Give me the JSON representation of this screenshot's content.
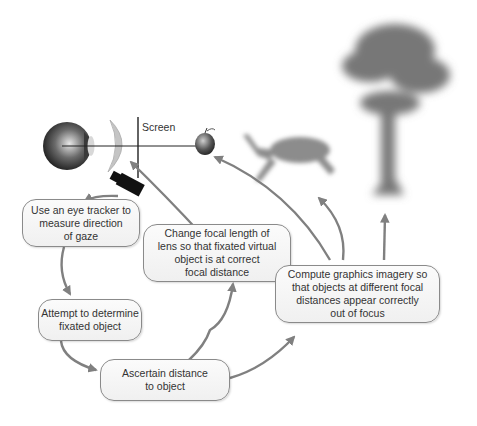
{
  "diagram": {
    "type": "flow",
    "screen_label": "Screen",
    "boxes": [
      {
        "id": "eye-tracker",
        "text": "Use an eye tracker to\nmeasure direction\nof gaze"
      },
      {
        "id": "fixated-object",
        "text": "Attempt to determine\nfixated object"
      },
      {
        "id": "ascertain-distance",
        "text": "Ascertain distance\nto object"
      },
      {
        "id": "change-focal",
        "text": "Change focal length of\nlens so that fixated virtual\nobject is at correct\nfocal distance"
      },
      {
        "id": "compute-graphics",
        "text": "Compute graphics imagery so\nthat objects at different focal\ndistances appear correctly\nout of focus"
      }
    ],
    "illustrations": [
      "eyeball",
      "lens",
      "screen",
      "eye-tracker-camera",
      "apple",
      "deer",
      "tree"
    ],
    "edges": [
      {
        "from": "eye-tracker-camera",
        "to": "eye-tracker"
      },
      {
        "from": "eye-tracker",
        "to": "fixated-object"
      },
      {
        "from": "fixated-object",
        "to": "ascertain-distance"
      },
      {
        "from": "ascertain-distance",
        "to": "change-focal"
      },
      {
        "from": "ascertain-distance",
        "to": "compute-graphics"
      },
      {
        "from": "change-focal",
        "to": "lens"
      },
      {
        "from": "compute-graphics",
        "to": "apple"
      },
      {
        "from": "compute-graphics",
        "to": "deer"
      },
      {
        "from": "compute-graphics",
        "to": "tree"
      }
    ],
    "colors": {
      "arrow": "#808080",
      "box_border": "#8a8a8a",
      "text": "#333333"
    }
  }
}
